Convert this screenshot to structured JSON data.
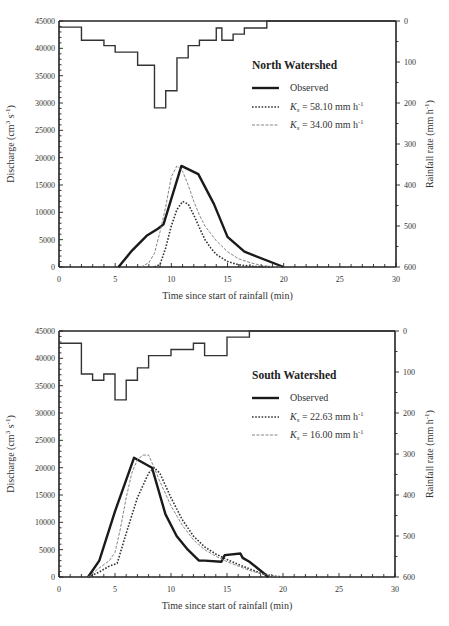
{
  "chart_data": [
    {
      "type": "line",
      "title": "North Watershed",
      "xlabel": "Time since start of rainfall (min)",
      "ylabel": "Discharge (cm^3 s^-1)",
      "y2label": "Rainfall rate (mm h^-1)",
      "xlim": [
        0,
        30
      ],
      "ylim": [
        0,
        45000
      ],
      "y2lim": [
        600,
        0
      ],
      "x_ticks": [
        "0",
        "5",
        "10",
        "15",
        "20",
        "25",
        "30"
      ],
      "y_ticks": [
        "0",
        "5000",
        "10000",
        "15000",
        "20000",
        "25000",
        "30000",
        "35000",
        "40000",
        "45000"
      ],
      "y2_ticks": [
        "0",
        "100",
        "200",
        "300",
        "400",
        "500",
        "600"
      ],
      "legend": [
        {
          "label": "Observed",
          "style": "solid-thick"
        },
        {
          "label": "K_s = 58.10 mm h^-1",
          "style": "dotted"
        },
        {
          "label": "K_s = 34.00 mm h^-1",
          "style": "dashed-thin"
        }
      ],
      "hyetograph": {
        "name": "Rainfall rate",
        "steps": [
          {
            "t0": 0,
            "t1": 2,
            "rate": 15
          },
          {
            "t0": 2,
            "t1": 4,
            "rate": 47
          },
          {
            "t0": 4,
            "t1": 5,
            "rate": 60
          },
          {
            "t0": 5,
            "t1": 7,
            "rate": 76
          },
          {
            "t0": 7,
            "t1": 8.5,
            "rate": 108
          },
          {
            "t0": 8.5,
            "t1": 9.5,
            "rate": 212
          },
          {
            "t0": 9.5,
            "t1": 10.5,
            "rate": 170
          },
          {
            "t0": 10.5,
            "t1": 11.5,
            "rate": 90
          },
          {
            "t0": 11.5,
            "t1": 12.5,
            "rate": 60
          },
          {
            "t0": 12.5,
            "t1": 14,
            "rate": 47
          },
          {
            "t0": 14,
            "t1": 14.5,
            "rate": 17
          },
          {
            "t0": 14.5,
            "t1": 15.5,
            "rate": 47
          },
          {
            "t0": 15.5,
            "t1": 16.5,
            "rate": 32
          },
          {
            "t0": 16.5,
            "t1": 18.5,
            "rate": 17
          },
          {
            "t0": 18.5,
            "t1": 30,
            "rate": 0
          }
        ]
      },
      "series": [
        {
          "name": "Observed",
          "x": [
            5.3,
            6.5,
            7.8,
            8.8,
            9.3,
            10.9,
            12.4,
            13.8,
            15,
            16.5,
            20
          ],
          "y": [
            0,
            3000,
            5700,
            7000,
            7800,
            18500,
            17000,
            11500,
            5500,
            2800,
            0
          ]
        },
        {
          "name": "K_s = 58.10 mm h^-1",
          "x": [
            8.5,
            9,
            9.5,
            10,
            10.5,
            11,
            11.5,
            12,
            12.5,
            13,
            13.5,
            14,
            15,
            16,
            17,
            18,
            19
          ],
          "y": [
            0,
            500,
            3500,
            7500,
            10500,
            12000,
            11500,
            9500,
            7200,
            5000,
            3500,
            2300,
            1000,
            400,
            150,
            50,
            0
          ]
        },
        {
          "name": "K_s = 34.00 mm h^-1",
          "x": [
            7.3,
            8,
            8.5,
            9,
            9.5,
            10,
            10.5,
            11,
            11.5,
            12,
            12.5,
            13,
            14,
            15,
            16,
            17,
            18,
            19,
            20
          ],
          "y": [
            0,
            800,
            2500,
            6500,
            11000,
            16500,
            18500,
            17500,
            15000,
            12000,
            9500,
            7500,
            4800,
            2800,
            1500,
            800,
            300,
            100,
            0
          ]
        }
      ]
    },
    {
      "type": "line",
      "title": "South Watershed",
      "xlabel": "Time since start of rainfall (min)",
      "ylabel": "Discharge (cm^3 s^-1)",
      "y2label": "Rainfall rate (mm h^-1)",
      "xlim": [
        0,
        30
      ],
      "ylim": [
        0,
        45000
      ],
      "y2lim": [
        600,
        0
      ],
      "x_ticks": [
        "0",
        "5",
        "10",
        "15",
        "20",
        "25",
        "30"
      ],
      "y_ticks": [
        "0",
        "5000",
        "10000",
        "15000",
        "20000",
        "25000",
        "30000",
        "35000",
        "40000",
        "45000"
      ],
      "y2_ticks": [
        "0",
        "100",
        "200",
        "300",
        "400",
        "500",
        "600"
      ],
      "legend": [
        {
          "label": "Observed",
          "style": "solid-thick"
        },
        {
          "label": "K_s = 22.63 mm h^-1",
          "style": "dotted"
        },
        {
          "label": "K_s = 16.00 mm h^-1",
          "style": "dashed-thin"
        }
      ],
      "hyetograph": {
        "name": "Rainfall rate",
        "steps": [
          {
            "t0": 0,
            "t1": 2,
            "rate": 30
          },
          {
            "t0": 2,
            "t1": 3,
            "rate": 105
          },
          {
            "t0": 3,
            "t1": 4,
            "rate": 120
          },
          {
            "t0": 4,
            "t1": 5,
            "rate": 105
          },
          {
            "t0": 5,
            "t1": 6,
            "rate": 168
          },
          {
            "t0": 6,
            "t1": 7,
            "rate": 120
          },
          {
            "t0": 7,
            "t1": 8,
            "rate": 90
          },
          {
            "t0": 8,
            "t1": 10,
            "rate": 60
          },
          {
            "t0": 10,
            "t1": 12,
            "rate": 45
          },
          {
            "t0": 12,
            "t1": 13,
            "rate": 30
          },
          {
            "t0": 13,
            "t1": 15,
            "rate": 60
          },
          {
            "t0": 15,
            "t1": 17,
            "rate": 15
          },
          {
            "t0": 17,
            "t1": 30,
            "rate": 0
          }
        ]
      },
      "series": [
        {
          "name": "Observed",
          "x": [
            2.6,
            3.6,
            5,
            6.7,
            8.3,
            9.5,
            10.5,
            11.5,
            12.5,
            13,
            14.5,
            14.6,
            14.8,
            16.2,
            16.4,
            17,
            18.7
          ],
          "y": [
            0,
            3000,
            12000,
            21800,
            20000,
            11500,
            7500,
            5000,
            3000,
            3000,
            2800,
            3200,
            4000,
            4300,
            3500,
            2800,
            0
          ]
        },
        {
          "name": "K_s = 22.63 mm h^-1",
          "x": [
            2.6,
            3.5,
            4.5,
            5.2,
            6,
            7,
            8,
            8.5,
            9,
            10,
            11,
            12,
            13,
            14,
            15,
            16,
            17,
            18,
            19,
            20
          ],
          "y": [
            0,
            800,
            2000,
            2500,
            8000,
            14500,
            19000,
            20000,
            19000,
            14500,
            10500,
            7500,
            5500,
            4200,
            3200,
            2300,
            1500,
            700,
            200,
            0
          ]
        },
        {
          "name": "K_s = 16.00 mm h^-1",
          "x": [
            2.6,
            3.5,
            4.5,
            5,
            5.5,
            6,
            6.5,
            7,
            7.5,
            8,
            8.5,
            9,
            10,
            11,
            12,
            13,
            14,
            15,
            16,
            17,
            18,
            19,
            20
          ],
          "y": [
            0,
            1500,
            3000,
            4500,
            9000,
            14500,
            19000,
            21500,
            22300,
            22300,
            20000,
            17500,
            13000,
            9500,
            6800,
            5000,
            3800,
            2800,
            2000,
            1200,
            600,
            200,
            0
          ]
        }
      ]
    }
  ],
  "panels": [
    {
      "title": "North Watershed",
      "legend": {
        "observed": "Observed",
        "ks1_value": "= 58.10 mm h",
        "ks2_value": "= 34.00 mm h"
      }
    },
    {
      "title": "South Watershed",
      "legend": {
        "observed": "Observed",
        "ks1_value": "= 22.63 mm h",
        "ks2_value": "= 16.00 mm h"
      }
    }
  ],
  "axes": {
    "xlabel": "Time since start of rainfall (min)",
    "ylabel_main": "Discharge (cm",
    "ylabel_s": "s",
    "y2label_main": "Rainfall rate (mm h",
    "ks_symbol": "K",
    "ks_sub": "s",
    "sup_3": "3",
    "sup_neg1": "-1"
  }
}
